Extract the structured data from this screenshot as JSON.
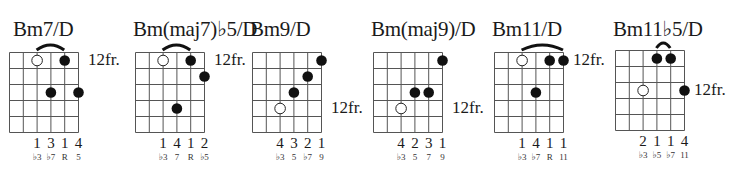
{
  "layout": {
    "string_spacing": 13.8,
    "fret_spacing": 16,
    "num_strings": 6,
    "num_frets": 5,
    "line_color": "#555555",
    "dot_color": "#111111"
  },
  "chords": [
    {
      "name": "Bm7/D",
      "left": 9,
      "grid_top": 52,
      "fret_label": "12fr.",
      "fret_label_row": 0,
      "dots": [
        {
          "string": 2,
          "fret": 0,
          "open": true
        },
        {
          "string": 4,
          "fret": 0,
          "open": false
        },
        {
          "string": 3,
          "fret": 2,
          "open": false
        },
        {
          "string": 5,
          "fret": 2,
          "open": false
        }
      ],
      "barre": {
        "from": 2,
        "to": 4
      },
      "fingers": [
        "1",
        "3",
        "1",
        "4"
      ],
      "intervals": [
        "♭3",
        "♭7",
        "R",
        "5"
      ],
      "label_strings": [
        2,
        3,
        4,
        5
      ]
    },
    {
      "name": "Bm(maj7)♭5/D",
      "left": 135,
      "grid_top": 52,
      "fret_label": "12fr.",
      "fret_label_row": 0,
      "dots": [
        {
          "string": 2,
          "fret": 0,
          "open": true
        },
        {
          "string": 4,
          "fret": 0,
          "open": false
        },
        {
          "string": 5,
          "fret": 1,
          "open": false
        },
        {
          "string": 3,
          "fret": 3,
          "open": false
        }
      ],
      "barre": {
        "from": 2,
        "to": 4
      },
      "fingers": [
        "1",
        "4",
        "1",
        "2"
      ],
      "intervals": [
        "♭3",
        "7",
        "R",
        "♭5"
      ],
      "label_strings": [
        2,
        3,
        4,
        5
      ]
    },
    {
      "name": "Bm9/D",
      "left": 252,
      "grid_top": 52,
      "fret_label": "12fr.",
      "fret_label_row": 3,
      "dots": [
        {
          "string": 5,
          "fret": 0,
          "open": false
        },
        {
          "string": 4,
          "fret": 1,
          "open": false
        },
        {
          "string": 3,
          "fret": 2,
          "open": false
        },
        {
          "string": 2,
          "fret": 3,
          "open": true
        }
      ],
      "barre": null,
      "fingers": [
        "4",
        "3",
        "2",
        "1"
      ],
      "intervals": [
        "♭3",
        "5",
        "♭7",
        "9"
      ],
      "label_strings": [
        2,
        3,
        4,
        5
      ]
    },
    {
      "name": "Bm(maj9)/D",
      "left": 373,
      "grid_top": 52,
      "fret_label": "12fr.",
      "fret_label_row": 3,
      "dots": [
        {
          "string": 5,
          "fret": 0,
          "open": false
        },
        {
          "string": 3,
          "fret": 2,
          "open": false
        },
        {
          "string": 4,
          "fret": 2,
          "open": false
        },
        {
          "string": 2,
          "fret": 3,
          "open": true
        }
      ],
      "barre": null,
      "fingers": [
        "4",
        "2",
        "3",
        "1"
      ],
      "intervals": [
        "♭3",
        "5",
        "7",
        "9"
      ],
      "label_strings": [
        2,
        3,
        4,
        5
      ]
    },
    {
      "name": "Bm11/D",
      "left": 494,
      "grid_top": 52,
      "fret_label": "12fr.",
      "fret_label_row": 0,
      "dots": [
        {
          "string": 2,
          "fret": 0,
          "open": true
        },
        {
          "string": 4,
          "fret": 0,
          "open": false
        },
        {
          "string": 5,
          "fret": 0,
          "open": false
        },
        {
          "string": 3,
          "fret": 2,
          "open": false
        }
      ],
      "barre": {
        "from": 2,
        "to": 5
      },
      "fingers": [
        "1",
        "4",
        "1",
        "1"
      ],
      "intervals": [
        "♭3",
        "♭7",
        "R",
        "11"
      ],
      "label_strings": [
        2,
        3,
        4,
        5
      ]
    },
    {
      "name": "Bm11♭5/D",
      "left": 615,
      "grid_top": 50,
      "fret_label": "12fr.",
      "fret_label_row": 2,
      "dots": [
        {
          "string": 3,
          "fret": 0,
          "open": false
        },
        {
          "string": 4,
          "fret": 0,
          "open": false
        },
        {
          "string": 2,
          "fret": 2,
          "open": true
        },
        {
          "string": 5,
          "fret": 2,
          "open": false
        }
      ],
      "barre": {
        "from": 3,
        "to": 4
      },
      "fingers": [
        "2",
        "1",
        "1",
        "4"
      ],
      "intervals": [
        "♭3",
        "♭5",
        "♭7",
        "11"
      ],
      "label_strings": [
        2,
        3,
        4,
        5
      ]
    }
  ]
}
